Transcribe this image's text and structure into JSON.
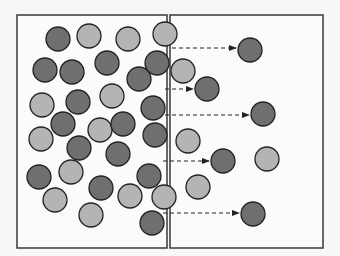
{
  "diagram": {
    "type": "diffusion-membrane",
    "colors": {
      "background": "#f7f7f7",
      "box_fill": "#fbfbfb",
      "box_stroke": "#3a3a3a",
      "dark_particle": "#6f6f6f",
      "light_particle": "#b4b4b4",
      "particle_stroke": "#222222",
      "arrow": "#222222"
    },
    "particle_radius": 12,
    "compartments": [
      {
        "name": "left-compartment",
        "x": 17,
        "y": 15,
        "w": 150,
        "h": 233
      },
      {
        "name": "right-compartment",
        "x": 170,
        "y": 15,
        "w": 153,
        "h": 233
      }
    ],
    "particles": [
      {
        "kind": "dark",
        "cx": 58,
        "cy": 39
      },
      {
        "kind": "light",
        "cx": 89,
        "cy": 36
      },
      {
        "kind": "light",
        "cx": 128,
        "cy": 39
      },
      {
        "kind": "dark",
        "cx": 45,
        "cy": 70
      },
      {
        "kind": "dark",
        "cx": 72,
        "cy": 72
      },
      {
        "kind": "dark",
        "cx": 107,
        "cy": 63
      },
      {
        "kind": "dark",
        "cx": 139,
        "cy": 79
      },
      {
        "kind": "dark",
        "cx": 157,
        "cy": 63
      },
      {
        "kind": "light",
        "cx": 42,
        "cy": 105
      },
      {
        "kind": "dark",
        "cx": 78,
        "cy": 102
      },
      {
        "kind": "light",
        "cx": 112,
        "cy": 96
      },
      {
        "kind": "dark",
        "cx": 153,
        "cy": 108
      },
      {
        "kind": "dark",
        "cx": 63,
        "cy": 124
      },
      {
        "kind": "light",
        "cx": 100,
        "cy": 130
      },
      {
        "kind": "dark",
        "cx": 123,
        "cy": 124
      },
      {
        "kind": "dark",
        "cx": 155,
        "cy": 135
      },
      {
        "kind": "light",
        "cx": 41,
        "cy": 139
      },
      {
        "kind": "dark",
        "cx": 79,
        "cy": 148
      },
      {
        "kind": "dark",
        "cx": 118,
        "cy": 154
      },
      {
        "kind": "dark",
        "cx": 39,
        "cy": 177
      },
      {
        "kind": "light",
        "cx": 71,
        "cy": 172
      },
      {
        "kind": "dark",
        "cx": 149,
        "cy": 176
      },
      {
        "kind": "light",
        "cx": 55,
        "cy": 200
      },
      {
        "kind": "dark",
        "cx": 101,
        "cy": 188
      },
      {
        "kind": "light",
        "cx": 130,
        "cy": 196
      },
      {
        "kind": "light",
        "cx": 91,
        "cy": 215
      },
      {
        "kind": "dark",
        "cx": 152,
        "cy": 223
      },
      {
        "kind": "light",
        "cx": 165,
        "cy": 34
      },
      {
        "kind": "light",
        "cx": 164,
        "cy": 197
      },
      {
        "kind": "light",
        "cx": 183,
        "cy": 71
      },
      {
        "kind": "light",
        "cx": 188,
        "cy": 141
      },
      {
        "kind": "light",
        "cx": 198,
        "cy": 187
      },
      {
        "kind": "light",
        "cx": 267,
        "cy": 159
      },
      {
        "kind": "dark",
        "cx": 250,
        "cy": 50
      },
      {
        "kind": "dark",
        "cx": 207,
        "cy": 89
      },
      {
        "kind": "dark",
        "cx": 263,
        "cy": 114
      },
      {
        "kind": "dark",
        "cx": 223,
        "cy": 161
      },
      {
        "kind": "dark",
        "cx": 253,
        "cy": 214
      }
    ],
    "arrows": [
      {
        "x1": 172,
        "x2": 236,
        "y": 48
      },
      {
        "x1": 165,
        "x2": 193,
        "y": 89
      },
      {
        "x1": 165,
        "x2": 249,
        "y": 115
      },
      {
        "x1": 163,
        "x2": 209,
        "y": 161
      },
      {
        "x1": 163,
        "x2": 239,
        "y": 213
      }
    ]
  }
}
